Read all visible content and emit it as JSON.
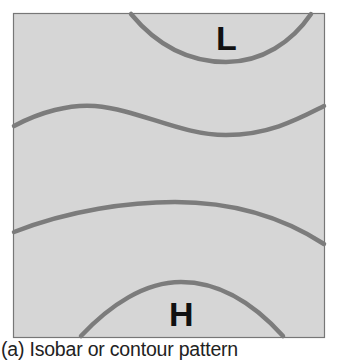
{
  "figure": {
    "caption": "(a) Isobar or contour pattern",
    "low_label": "L",
    "high_label": "H",
    "colors": {
      "background": "#d6d6d6",
      "border": "#777777",
      "contour_line": "#7a7a7a",
      "label": "#111111"
    }
  }
}
